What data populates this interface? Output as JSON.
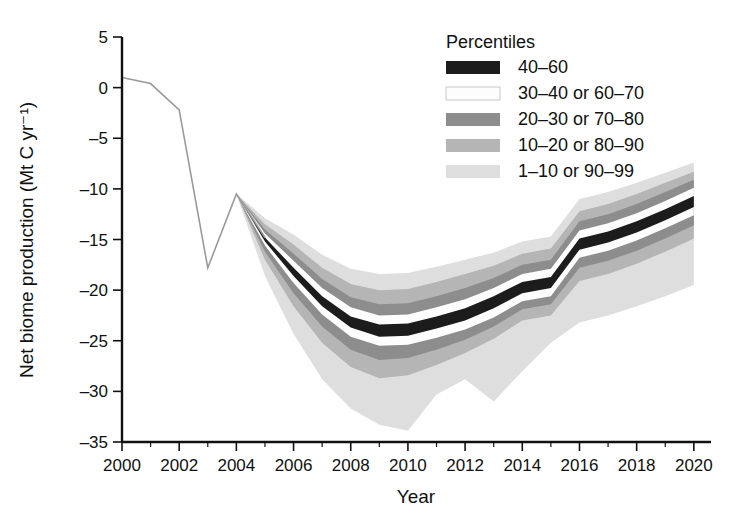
{
  "chart_data": {
    "type": "area",
    "title": "",
    "xlabel": "Year",
    "ylabel": "Net biome production (Mt C yr⁻¹)",
    "xlim": [
      2000,
      2020.6
    ],
    "ylim": [
      -35,
      5
    ],
    "xticks": [
      2000,
      2002,
      2004,
      2006,
      2008,
      2010,
      2012,
      2014,
      2016,
      2018,
      2020
    ],
    "xtick_labels": [
      "2000",
      "2002",
      "2004",
      "2006",
      "2008",
      "2010",
      "2012",
      "2014",
      "2016",
      "2018",
      "2020"
    ],
    "xminor_ticks": [
      2001,
      2003,
      2005,
      2007,
      2009,
      2011,
      2013,
      2015,
      2017,
      2019
    ],
    "yticks": [
      5,
      0,
      -5,
      -10,
      -15,
      -20,
      -25,
      -30,
      -35
    ],
    "ytick_labels": [
      "5",
      "0",
      "–5",
      "–10",
      "–15",
      "–20",
      "–25",
      "–30",
      "–35"
    ],
    "grid": false,
    "legend_position": "top-right",
    "x": [
      2000,
      2001,
      2002,
      2003,
      2004,
      2005,
      2006,
      2007,
      2008,
      2009,
      2010,
      2011,
      2012,
      2013,
      2014,
      2015,
      2016,
      2017,
      2018,
      2019,
      2020
    ],
    "series": [
      {
        "name": "40-60",
        "role": "median-band-upper",
        "values": [
          1.0,
          0.4,
          -2.2,
          -17.8,
          -10.5,
          -14.8,
          -17.8,
          -20.6,
          -22.6,
          -23.4,
          -23.3,
          -22.6,
          -21.8,
          -20.6,
          -19.2,
          -18.7,
          -14.9,
          -14.2,
          -13.2,
          -12.0,
          -10.7
        ]
      },
      {
        "name": "40-60",
        "role": "median-band-lower",
        "values": [
          1.0,
          0.4,
          -2.2,
          -17.8,
          -10.5,
          -15.2,
          -18.6,
          -21.6,
          -23.7,
          -24.6,
          -24.5,
          -23.8,
          -23.0,
          -21.8,
          -20.3,
          -19.8,
          -16.0,
          -15.3,
          -14.3,
          -13.1,
          -11.8
        ]
      },
      {
        "name": "30-40 or 60-70",
        "role": "band-upper",
        "values": [
          1.0,
          0.4,
          -2.2,
          -17.8,
          -10.5,
          -14.4,
          -17.1,
          -19.8,
          -21.7,
          -22.5,
          -22.4,
          -21.7,
          -20.9,
          -19.8,
          -18.4,
          -17.9,
          -14.1,
          -13.4,
          -12.4,
          -11.2,
          -9.9
        ]
      },
      {
        "name": "30-40 or 60-70",
        "role": "band-lower",
        "values": [
          1.0,
          0.4,
          -2.2,
          -17.8,
          -10.5,
          -15.6,
          -19.3,
          -22.4,
          -24.6,
          -25.5,
          -25.4,
          -24.7,
          -23.9,
          -22.7,
          -21.1,
          -20.6,
          -16.8,
          -16.1,
          -15.1,
          -13.9,
          -12.6
        ]
      },
      {
        "name": "20-30 or 70-80",
        "role": "band-upper",
        "values": [
          1.0,
          0.4,
          -2.2,
          -17.8,
          -10.5,
          -14.0,
          -16.4,
          -18.9,
          -20.7,
          -21.4,
          -21.3,
          -20.6,
          -19.8,
          -18.8,
          -17.5,
          -17.0,
          -13.2,
          -12.5,
          -11.5,
          -10.3,
          -9.1
        ]
      },
      {
        "name": "20-30 or 70-80",
        "role": "band-lower",
        "values": [
          1.0,
          0.4,
          -2.2,
          -17.8,
          -10.5,
          -16.2,
          -20.3,
          -23.6,
          -25.9,
          -26.9,
          -26.7,
          -25.9,
          -24.9,
          -23.6,
          -21.9,
          -21.4,
          -17.8,
          -17.1,
          -16.1,
          -14.9,
          -13.6
        ]
      },
      {
        "name": "10-20 or 80-90",
        "role": "band-upper",
        "values": [
          1.0,
          0.4,
          -2.2,
          -17.8,
          -10.5,
          -13.5,
          -15.5,
          -17.8,
          -19.4,
          -20.0,
          -19.9,
          -19.2,
          -18.4,
          -17.6,
          -16.4,
          -15.9,
          -12.2,
          -11.5,
          -10.5,
          -9.4,
          -8.3
        ]
      },
      {
        "name": "10-20 or 80-90",
        "role": "band-lower",
        "values": [
          1.0,
          0.4,
          -2.2,
          -17.8,
          -10.5,
          -17.0,
          -21.6,
          -25.2,
          -27.6,
          -28.7,
          -28.4,
          -27.4,
          -26.2,
          -24.8,
          -23.0,
          -22.5,
          -19.1,
          -18.4,
          -17.4,
          -16.2,
          -14.9
        ]
      },
      {
        "name": "1-10 or 90-99",
        "role": "band-upper",
        "values": [
          1.0,
          0.4,
          -2.2,
          -17.8,
          -10.5,
          -12.9,
          -14.5,
          -16.5,
          -17.9,
          -18.4,
          -18.3,
          -17.7,
          -17.0,
          -16.3,
          -15.2,
          -14.7,
          -11.0,
          -10.3,
          -9.4,
          -8.4,
          -7.4
        ]
      },
      {
        "name": "1-10 or 90-99",
        "role": "band-lower",
        "values": [
          1.0,
          0.4,
          -2.2,
          -17.8,
          -10.5,
          -18.6,
          -24.3,
          -28.8,
          -31.7,
          -33.3,
          -33.9,
          -30.3,
          -28.8,
          -31.0,
          -28.0,
          -25.2,
          -23.2,
          -22.5,
          -21.6,
          -20.6,
          -19.5
        ]
      }
    ]
  },
  "legend": {
    "title": "Percentiles",
    "items": [
      {
        "label": "40–60",
        "color": "#1c1c1c"
      },
      {
        "label": "30–40 or 60–70",
        "color": "#fdfdfd"
      },
      {
        "label": "20–30 or 70–80",
        "color": "#8d8d8d"
      },
      {
        "label": "10–20 or 80–90",
        "color": "#b5b5b5"
      },
      {
        "label": "1–10 or 90–99",
        "color": "#dedede"
      }
    ]
  },
  "colors": {
    "axis": "#111111",
    "background": "#ffffff",
    "median_dark": "#1c1c1c",
    "band_white": "#fdfdfd",
    "band_mid": "#8d8d8d",
    "band_light": "#b5b5b5",
    "band_lightest": "#dedede",
    "early_line": "#9a9a9a"
  }
}
